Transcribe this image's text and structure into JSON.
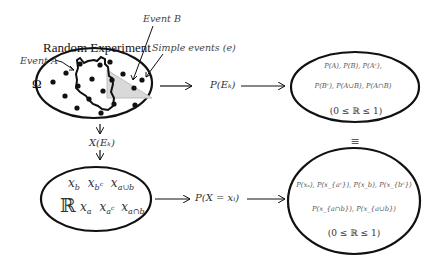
{
  "diagram": {
    "labels": {
      "random_experiment": "Random Experiment",
      "event_a": "Event A",
      "event_b": "Event B",
      "simple_events": "Simple events (e)",
      "omega": "Ω",
      "p_ek": "P(Eₖ)",
      "x_ek": "X(Eₖ)",
      "p_x_eq_xi": "P(X = xᵢ)",
      "equiv": "≡"
    },
    "top_right_ellipse": {
      "line1": "P(A), P(B), P(Aᶜ),",
      "line2": "P(Bᶜ), P(A∪B), P(A∩B)",
      "range": "(0 ≤ ℝ ≤ 1)"
    },
    "bottom_left_ellipse": {
      "reals_symbol": "ℝ",
      "row1": [
        "x_b",
        "x_{b^c}",
        "x_{a∪b}"
      ],
      "row1_display": {
        "a": "x",
        "a_sub": "b",
        "b": "x",
        "b_sub": "b",
        "b_sup": "c",
        "c": "x",
        "c_sub": "a∪b"
      },
      "row2_display": {
        "a": "x",
        "a_sub": "a",
        "b": "x",
        "b_sub": "a",
        "b_sup": "c",
        "c": "x",
        "c_sub": "a∩b"
      }
    },
    "bottom_right_ellipse": {
      "line1": "P(xₐ), P(x_{aᶜ}), P(x_b), P(x_{bᶜ})",
      "line2": "P(x_{a∩b}), P(x_{a∪b})",
      "range": "(0 ≤ ℝ ≤ 1)"
    },
    "colors": {
      "stroke": "#111111",
      "event_b_fill": "#d9d9d9",
      "text": "#333333"
    }
  }
}
